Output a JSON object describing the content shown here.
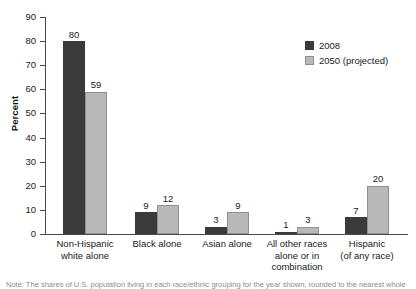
{
  "chart_data": {
    "type": "bar",
    "title": "",
    "xlabel": "",
    "ylabel": "Percent",
    "ylim": [
      0,
      90
    ],
    "yticks": [
      0,
      10,
      20,
      30,
      40,
      50,
      60,
      70,
      80,
      90
    ],
    "grid": false,
    "legend_position": "top-right",
    "categories": [
      "Non-Hispanic\nwhite alone",
      "Black alone",
      "Asian alone",
      "All other races\nalone or in\ncombination",
      "Hispanic\n(of any race)"
    ],
    "category_lines": [
      [
        "Non-Hispanic",
        "white alone"
      ],
      [
        "Black alone"
      ],
      [
        "Asian alone"
      ],
      [
        "All other races",
        "alone or in",
        "combination"
      ],
      [
        "Hispanic",
        "(of any race)"
      ]
    ],
    "series": [
      {
        "name": "2008",
        "color": "#3a3a3a",
        "values": [
          80,
          9,
          3,
          1,
          7
        ]
      },
      {
        "name": "2050 (projected)",
        "color": "#b9b9b9",
        "values": [
          59,
          12,
          9,
          3,
          20
        ]
      }
    ]
  },
  "legend": {
    "items": [
      {
        "label": "2008"
      },
      {
        "label": "2050 (projected)"
      }
    ]
  },
  "footnote": {
    "text": "Note: The shares of U.S. population living in each race/ethnic grouping for the year shown, rounded to the nearest whole"
  },
  "colors": {
    "series_2008": "#3a3a3a",
    "series_2050": "#b9b9b9",
    "axis": "#4a4a4a",
    "text": "#1a1a1a",
    "background": "#ffffff"
  }
}
